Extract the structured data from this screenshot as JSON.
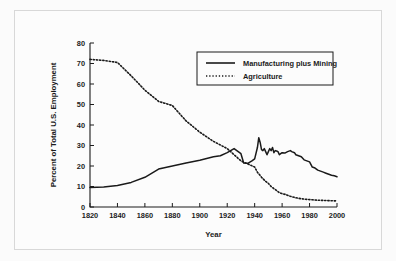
{
  "figure": {
    "name": "us-employment-sectors-chart"
  },
  "chart_data": {
    "type": "line",
    "title": "",
    "xlabel": "Year",
    "ylabel": "Percent of Total U.S. Employment",
    "xlim": [
      1820,
      2000
    ],
    "ylim": [
      0,
      80
    ],
    "xticks": [
      1820,
      1840,
      1860,
      1880,
      1900,
      1920,
      1940,
      1960,
      1980,
      2000
    ],
    "yticks": [
      0,
      10,
      20,
      30,
      40,
      50,
      60,
      70,
      80
    ],
    "xtick_labels": [
      "1820",
      "1840",
      "1860",
      "1880",
      "1900",
      "1920",
      "1940",
      "1960",
      "1980",
      "2000"
    ],
    "ytick_labels": [
      "0",
      "10",
      "20",
      "30",
      "40",
      "50",
      "60",
      "70",
      "80"
    ],
    "grid": false,
    "legend_position": "upper right",
    "series": [
      {
        "name": "Manufacturing plus Mining",
        "style": "solid",
        "color": "#1a1a1a",
        "x": [
          1820,
          1830,
          1840,
          1850,
          1860,
          1870,
          1875,
          1880,
          1890,
          1900,
          1910,
          1915,
          1920,
          1925,
          1930,
          1932,
          1935,
          1938,
          1940,
          1942,
          1943,
          1944,
          1945,
          1946,
          1947,
          1948,
          1949,
          1950,
          1951,
          1952,
          1953,
          1954,
          1955,
          1956,
          1957,
          1958,
          1960,
          1962,
          1964,
          1966,
          1967,
          1969,
          1970,
          1972,
          1974,
          1976,
          1978,
          1980,
          1982,
          1984,
          1986,
          1988,
          1990,
          1992,
          1994,
          1996,
          1998,
          2000
        ],
        "y": [
          9.5,
          9.8,
          10.5,
          12.0,
          14.5,
          18.5,
          19.3,
          20.0,
          21.5,
          22.8,
          24.5,
          25.0,
          26.5,
          28.5,
          26.0,
          21.5,
          21.3,
          22.5,
          23.5,
          29.0,
          33.8,
          31.5,
          28.0,
          27.5,
          28.5,
          27.0,
          25.5,
          27.0,
          28.5,
          27.5,
          29.0,
          26.5,
          27.5,
          27.3,
          27.0,
          25.5,
          26.5,
          26.3,
          27.0,
          27.5,
          27.0,
          26.5,
          25.5,
          25.0,
          24.5,
          23.0,
          22.5,
          22.0,
          19.5,
          19.0,
          18.0,
          17.5,
          17.0,
          16.5,
          16.0,
          15.5,
          15.2,
          14.8
        ]
      },
      {
        "name": "Agriculture",
        "style": "dotted",
        "color": "#1a1a1a",
        "x": [
          1820,
          1830,
          1840,
          1850,
          1860,
          1870,
          1880,
          1890,
          1900,
          1910,
          1920,
          1930,
          1935,
          1940,
          1942,
          1945,
          1948,
          1950,
          1952,
          1955,
          1958,
          1960,
          1963,
          1966,
          1970,
          1974,
          1978,
          1982,
          1986,
          1990,
          1994,
          1998,
          2000
        ],
        "y": [
          72.0,
          71.5,
          70.5,
          64.0,
          57.0,
          51.5,
          49.5,
          42.0,
          36.5,
          32.0,
          28.5,
          22.5,
          21.0,
          19.5,
          17.0,
          14.5,
          12.5,
          11.5,
          10.0,
          8.5,
          7.0,
          6.5,
          6.0,
          5.2,
          4.5,
          4.0,
          3.7,
          3.5,
          3.3,
          3.2,
          3.1,
          3.0,
          3.0
        ]
      }
    ],
    "legend": [
      {
        "label": "Manufacturing plus Mining",
        "style": "solid"
      },
      {
        "label": "Agriculture",
        "style": "dotted"
      }
    ]
  }
}
